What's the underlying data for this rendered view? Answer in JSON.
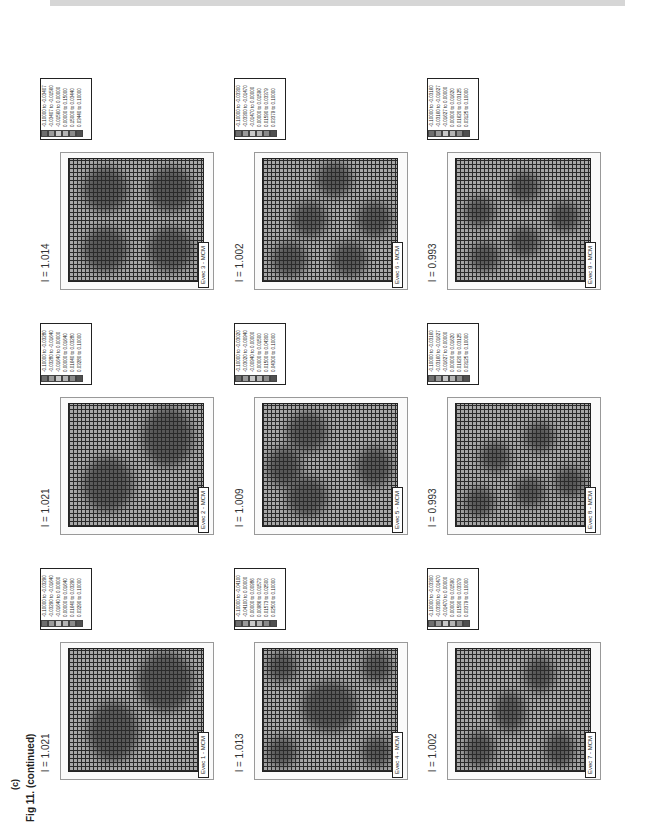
{
  "figure": {
    "panel_label": "(c)",
    "caption": "Fig 11.  (continued)"
  },
  "chart_data": [
    {
      "type": "heatmap",
      "title": "Evec 1 - MCM",
      "lambda": "l = 1.021",
      "legend": [
        "-0.10000 to -0.03290",
        "-0.03290 to -0.01640",
        "-0.01640 to 0.00000",
        "0.00000 to 0.01640",
        "0.01640 to 0.03290",
        "0.03290 to 0.10000"
      ]
    },
    {
      "type": "heatmap",
      "title": "Evec 2 - MCM",
      "lambda": "l = 1.021",
      "legend": [
        "-0.10000 to -0.03280",
        "-0.03280 to -0.01640",
        "-0.01640 to 0.00000",
        "0.00000 to 0.01640",
        "0.01640 to 0.03280",
        "0.03280 to 0.10000"
      ]
    },
    {
      "type": "heatmap",
      "title": "Evec 3 - MCM",
      "lambda": "l = 1.014",
      "legend": [
        "-0.10000 to -0.03407",
        "-0.03407 to -0.01560",
        "-0.01560 to 0.00000",
        "0.00000 to 0.15000",
        "0.15000 to 0.03440",
        "0.03440 to 0.10000"
      ]
    },
    {
      "type": "heatmap",
      "title": "Evec 4 - MCM",
      "lambda": "l = 1.013",
      "legend": [
        "-0.10000 to -0.04100",
        "-0.04100 to 0.00000",
        "0.00000 to 0.00986",
        "0.00986 to 0.01573",
        "0.01573 to 0.02500",
        "0.02500 to 0.10000"
      ]
    },
    {
      "type": "heatmap",
      "title": "Evec 5 - MCM",
      "lambda": "l = 1.009",
      "legend": [
        "-0.10000 to -0.03020",
        "-0.03020 to -0.00940",
        "-0.00940 to 0.00000",
        "0.00000 to 0.01500",
        "0.01500 to 0.04300",
        "0.04300 to 0.10000"
      ]
    },
    {
      "type": "heatmap",
      "title": "Evec 6 - MCM",
      "lambda": "l = 1.002",
      "legend": [
        "-0.10000 to -0.03300",
        "-0.03300 to -0.01470",
        "-0.01470 to 0.00000",
        "0.00000 to 0.01590",
        "0.01590 to 0.03379",
        "0.03379 to 0.10000"
      ]
    },
    {
      "type": "heatmap",
      "title": "Evec 7 - MCM",
      "lambda": "l = 1.002",
      "legend": [
        "-0.10000 to -0.03300",
        "-0.03300 to -0.01470",
        "-0.01470 to 0.00000",
        "0.00000 to 0.01590",
        "0.01590 to 0.03379",
        "0.03379 to 0.10000"
      ]
    },
    {
      "type": "heatmap",
      "title": "Evec 8 - MCM",
      "lambda": "l = 0.993",
      "legend": [
        "-0.10000 to -0.03160",
        "-0.03160 to -0.01627",
        "-0.01627 to 0.00000",
        "0.00000 to 0.01620",
        "0.01620 to 0.03125",
        "0.03125 to 0.10000"
      ]
    },
    {
      "type": "heatmap",
      "title": "Evec 9 - MCM",
      "lambda": "l = 0.993",
      "legend": [
        "-0.10000 to -0.03160",
        "-0.03160 to -0.01627",
        "-0.01627 to 0.00000",
        "0.00000 to 0.01620",
        "0.01620 to 0.03125",
        "0.03125 to 0.10000"
      ]
    }
  ],
  "legend_colors": [
    "#6e6e6e",
    "#9a9a9a",
    "#c8c8c8",
    "#b4b4b4",
    "#8a8a8a",
    "#505050"
  ]
}
